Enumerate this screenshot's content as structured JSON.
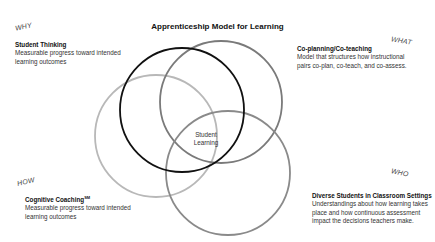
{
  "title": "Apprenticeship Model for Learning",
  "center_label": [
    "Student",
    "Learning"
  ],
  "quadrants": {
    "why": {
      "tag": "WHY",
      "heading": "Student Thinking",
      "lines": [
        "Measurable progress toward intended",
        "learning outcomes"
      ]
    },
    "what": {
      "tag": "WHAT",
      "heading": "Co-planning/Co-teaching",
      "lines": [
        "Model that structures how instructional",
        "pairs co-plan, co-teach, and co-assess."
      ]
    },
    "how": {
      "tag": "HOW",
      "heading": "Cognitive Coaching",
      "heading_sup": "SM",
      "lines": [
        "Measurable progress toward intended",
        "learning outcomes"
      ]
    },
    "who": {
      "tag": "WHO",
      "heading": "Diverse Students in Classroom Settings",
      "lines": [
        "Understandings about how learning takes",
        "place and how continuous assessment",
        "impact the decisions teachers make."
      ]
    }
  },
  "circles": [
    {
      "name": "how-circle",
      "cx": 156,
      "cy": 136,
      "r": 61,
      "color": "#b8b8b8"
    },
    {
      "name": "what-circle",
      "cx": 221,
      "cy": 102,
      "r": 61,
      "color": "#7a7a7a"
    },
    {
      "name": "who-circle",
      "cx": 228,
      "cy": 173,
      "r": 62,
      "color": "#8a8a8a"
    },
    {
      "name": "why-circle",
      "cx": 182,
      "cy": 110,
      "r": 62,
      "color": "#111111"
    }
  ]
}
